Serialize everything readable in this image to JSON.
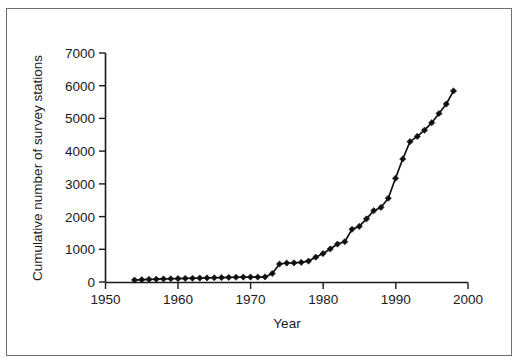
{
  "figure": {
    "frame_color": "#6e6e6e",
    "background": "#ffffff"
  },
  "chart_data": {
    "type": "line",
    "title": "",
    "subtitle": "",
    "xlabel": "Year",
    "ylabel": "Cumulative number of survey stations",
    "xlim": [
      1950,
      2000
    ],
    "ylim": [
      0,
      7000
    ],
    "xticks": [
      1950,
      1960,
      1970,
      1980,
      1990,
      2000
    ],
    "xtick_labels": [
      "1950",
      "1960",
      "1970",
      "1980",
      "1990",
      "2000"
    ],
    "yticks": [
      0,
      1000,
      2000,
      3000,
      4000,
      5000,
      6000,
      7000
    ],
    "ytick_labels": [
      "0",
      "1000",
      "2000",
      "3000",
      "4000",
      "5000",
      "6000",
      "7000"
    ],
    "grid": false,
    "legend": null,
    "legend_position": "none",
    "marker": "filled-diamond",
    "line_color": "#111111",
    "marker_color": "#111111",
    "series": [
      {
        "name": "Cumulative number of survey stations",
        "x": [
          1954,
          1955,
          1956,
          1957,
          1958,
          1959,
          1960,
          1961,
          1962,
          1963,
          1964,
          1965,
          1966,
          1967,
          1968,
          1969,
          1970,
          1971,
          1972,
          1973,
          1974,
          1975,
          1976,
          1977,
          1978,
          1979,
          1980,
          1981,
          1982,
          1983,
          1984,
          1985,
          1986,
          1987,
          1988,
          1989,
          1990,
          1991,
          1992,
          1993,
          1994,
          1995,
          1996,
          1997,
          1998
        ],
        "values": [
          60,
          70,
          80,
          85,
          95,
          100,
          105,
          110,
          115,
          120,
          125,
          130,
          135,
          140,
          145,
          150,
          150,
          150,
          155,
          260,
          550,
          580,
          585,
          600,
          640,
          760,
          870,
          1010,
          1160,
          1230,
          1610,
          1700,
          1930,
          2180,
          2280,
          2560,
          3170,
          3760,
          4290,
          4450,
          4640,
          4870,
          5150,
          5440,
          5840
        ]
      }
    ],
    "annotations": []
  },
  "axes": {
    "x_axis_label": "Year",
    "y_axis_label": "Cumulative number of survey stations"
  }
}
